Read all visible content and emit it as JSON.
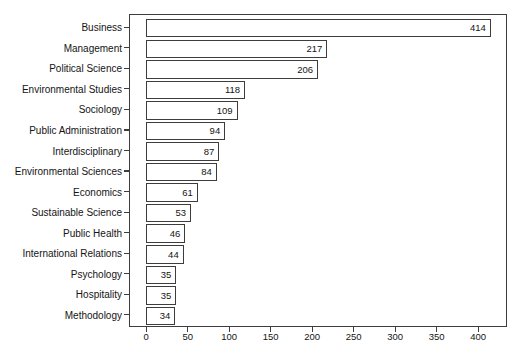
{
  "figure": {
    "background_color": "#ffffff",
    "axis_line_color": "#3d3d3d",
    "text_color": "#141414",
    "bar_fill_color": "#ffffff",
    "bar_edge_color": "#3d3d3d"
  },
  "chart_data": {
    "type": "bar",
    "orientation": "horizontal",
    "title": "",
    "xlabel": "",
    "ylabel": "",
    "grid": false,
    "legend": null,
    "categories": [
      "Business",
      "Management",
      "Political Science",
      "Environmental Studies",
      "Sociology",
      "Public Administration",
      "Interdisciplinary",
      "Environmental Sciences",
      "Economics",
      "Sustainable Science",
      "Public Health",
      "International Relations",
      "Psychology",
      "Hospitality",
      "Methodology"
    ],
    "values": [
      414,
      217,
      206,
      118,
      109,
      94,
      87,
      84,
      61,
      53,
      46,
      44,
      35,
      35,
      34
    ],
    "value_labels": [
      "414",
      "217",
      "206",
      "118",
      "109",
      "94",
      "87",
      "84",
      "61",
      "53",
      "46",
      "44",
      "35",
      "35",
      "34"
    ],
    "value_label_position": "inside-end",
    "x_ticks": [
      0,
      50,
      100,
      150,
      200,
      250,
      300,
      350,
      400
    ],
    "x_tick_labels": [
      "0",
      "50",
      "100",
      "150",
      "200",
      "250",
      "300",
      "350",
      "400"
    ],
    "xlim": [
      -20.7,
      434.7
    ]
  }
}
